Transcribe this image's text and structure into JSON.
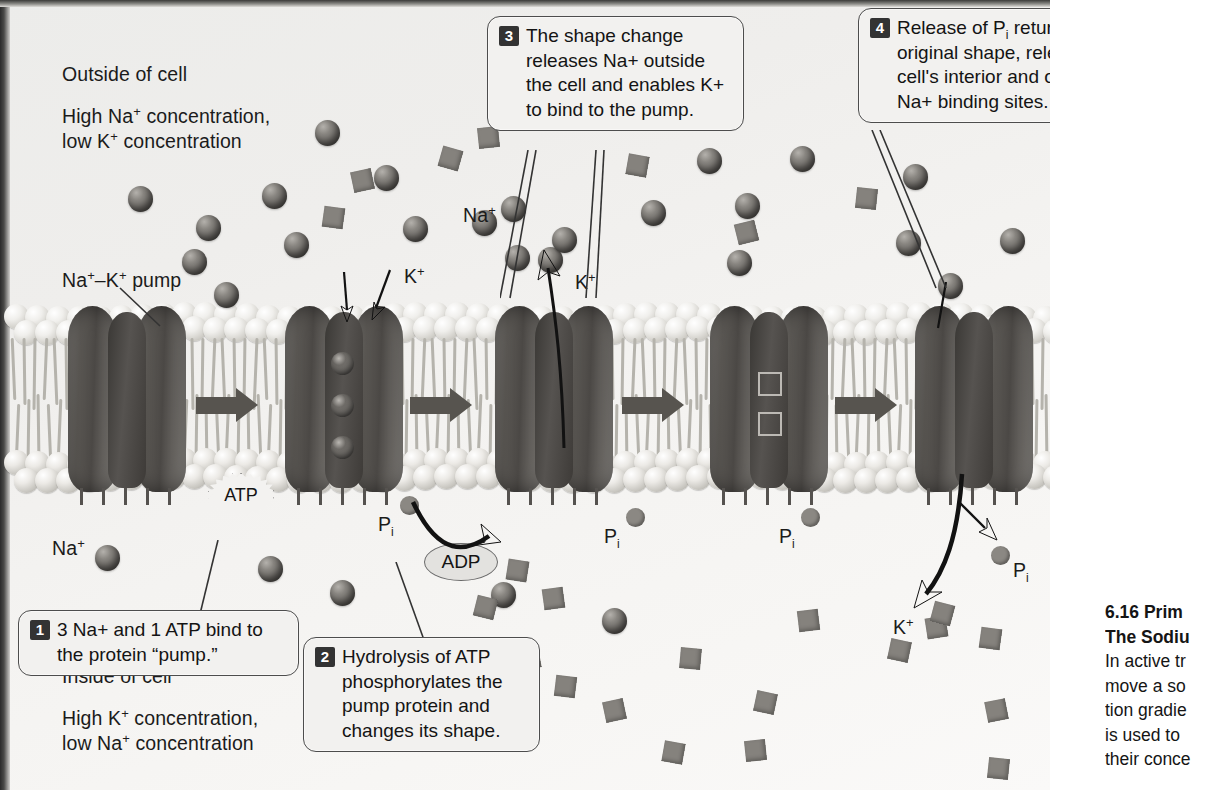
{
  "figure": {
    "environment_labels": {
      "outside_title": "Outside of cell",
      "outside_conc_line1": "High Na+ concentration,",
      "outside_conc_line2": "low K+ concentration",
      "pump_label": "Na+–K+ pump",
      "inside_title": "Inside of cell",
      "inside_conc_line1": "High K+ concentration,",
      "inside_conc_line2": "low Na+ concentration"
    },
    "ion_labels": {
      "na_outside_upper": "Na+",
      "na_outside_lower": "Na+",
      "k_outside_left": "K+",
      "k_outside_right": "K+",
      "k_inside": "K+"
    },
    "molecule_labels": {
      "atp": "ATP",
      "adp": "ADP",
      "pi_1": "Pi",
      "pi_2": "Pi",
      "pi_3": "Pi",
      "pi_4": "Pi"
    },
    "steps": [
      {
        "number": "1",
        "lines": [
          "3 Na+ and 1 ATP bind to",
          "the protein \"pump.\""
        ]
      },
      {
        "number": "2",
        "lines": [
          "Hydrolysis of ATP",
          "phosphorylates the",
          "pump protein and",
          "changes its shape."
        ]
      },
      {
        "number": "3",
        "lines": [
          "The shape change",
          "releases Na+ outside",
          "the cell and enables K+",
          "to bind to the pump."
        ]
      },
      {
        "number": "4",
        "lines": [
          "Release of Pi returns the pump to its",
          "original shape, releasing K+ to the",
          "cell's interior and once again exposing",
          "Na+ binding sites. The cycle repeats."
        ]
      }
    ],
    "colors": {
      "panel_background": "#f2f1ef",
      "membrane_head_outer": "#f0efec",
      "membrane_head_inner": "#eceae6",
      "lipid_tail": "#b5b3ac",
      "pump_protein": "#5c5955",
      "sodium_ion": "#6b6864",
      "potassium_ion": "#85827d",
      "callout_border": "#4d4d4d",
      "step_badge": "#333333"
    }
  },
  "caption": {
    "title_line1": "6.16  Prim",
    "title_line2": "The Sodiu",
    "body_lines": [
      "In active tr",
      "move a so",
      "tion gradie",
      "is used to",
      "their conce"
    ]
  },
  "na_ions_outside": [
    {
      "x": 128,
      "y": 186
    },
    {
      "x": 196,
      "y": 215
    },
    {
      "x": 262,
      "y": 183
    },
    {
      "x": 182,
      "y": 249
    },
    {
      "x": 214,
      "y": 282
    },
    {
      "x": 284,
      "y": 232
    },
    {
      "x": 315,
      "y": 120
    },
    {
      "x": 374,
      "y": 165
    },
    {
      "x": 403,
      "y": 216
    },
    {
      "x": 472,
      "y": 210
    },
    {
      "x": 501,
      "y": 196
    },
    {
      "x": 505,
      "y": 245
    },
    {
      "x": 538,
      "y": 247
    },
    {
      "x": 552,
      "y": 227
    },
    {
      "x": 641,
      "y": 200
    },
    {
      "x": 697,
      "y": 148
    },
    {
      "x": 735,
      "y": 193
    },
    {
      "x": 727,
      "y": 250
    },
    {
      "x": 790,
      "y": 146
    },
    {
      "x": 896,
      "y": 230
    },
    {
      "x": 903,
      "y": 164
    },
    {
      "x": 1000,
      "y": 228
    },
    {
      "x": 938,
      "y": 273
    }
  ],
  "k_ions_outside": [
    {
      "x": 352,
      "y": 170,
      "r": -12
    },
    {
      "x": 323,
      "y": 207,
      "r": 8
    },
    {
      "x": 440,
      "y": 148,
      "r": 16
    },
    {
      "x": 478,
      "y": 127,
      "r": -6
    },
    {
      "x": 627,
      "y": 155,
      "r": 10
    },
    {
      "x": 736,
      "y": 222,
      "r": -14
    },
    {
      "x": 856,
      "y": 188,
      "r": 6
    }
  ],
  "na_ions_inside": [
    {
      "x": 95,
      "y": 545
    },
    {
      "x": 258,
      "y": 556
    },
    {
      "x": 330,
      "y": 580
    },
    {
      "x": 491,
      "y": 582
    },
    {
      "x": 602,
      "y": 608
    }
  ],
  "k_ions_inside": [
    {
      "x": 507,
      "y": 560,
      "r": 9
    },
    {
      "x": 543,
      "y": 588,
      "r": -8
    },
    {
      "x": 475,
      "y": 597,
      "r": 14
    },
    {
      "x": 519,
      "y": 648,
      "r": -10
    },
    {
      "x": 555,
      "y": 676,
      "r": 7
    },
    {
      "x": 604,
      "y": 700,
      "r": -12
    },
    {
      "x": 663,
      "y": 742,
      "r": 10
    },
    {
      "x": 680,
      "y": 648,
      "r": 5
    },
    {
      "x": 745,
      "y": 740,
      "r": -6
    },
    {
      "x": 755,
      "y": 692,
      "r": 12
    },
    {
      "x": 926,
      "y": 617,
      "r": -9
    },
    {
      "x": 932,
      "y": 603,
      "r": 15
    },
    {
      "x": 980,
      "y": 628,
      "r": 8
    },
    {
      "x": 986,
      "y": 700,
      "r": -11
    },
    {
      "x": 988,
      "y": 758,
      "r": 6
    },
    {
      "x": 889,
      "y": 640,
      "r": 12
    },
    {
      "x": 798,
      "y": 610,
      "r": -7
    }
  ]
}
